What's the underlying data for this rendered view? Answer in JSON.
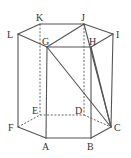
{
  "figure": {
    "stroke_color": "#555555",
    "background": "#ffffff",
    "vertices": {
      "A": {
        "x": 46,
        "y": 138,
        "label": "A",
        "lx": 42,
        "ly": 150
      },
      "B": {
        "x": 91,
        "y": 138,
        "label": "B",
        "lx": 87,
        "ly": 150
      },
      "C": {
        "x": 111,
        "y": 127,
        "label": "C",
        "lx": 114,
        "ly": 131
      },
      "D": {
        "x": 84,
        "y": 115,
        "label": "D",
        "lx": 75,
        "ly": 114
      },
      "E": {
        "x": 40,
        "y": 115,
        "label": "E",
        "lx": 32,
        "ly": 114
      },
      "F": {
        "x": 18,
        "y": 127,
        "label": "F",
        "lx": 8,
        "ly": 131
      },
      "G": {
        "x": 47,
        "y": 47,
        "label": "G",
        "lx": 42,
        "ly": 45
      },
      "H": {
        "x": 91,
        "y": 47,
        "label": "H",
        "lx": 89,
        "ly": 45
      },
      "I": {
        "x": 113,
        "y": 34,
        "label": "I",
        "lx": 116,
        "ly": 38
      },
      "J": {
        "x": 84,
        "y": 24,
        "label": "J",
        "lx": 81,
        "ly": 21
      },
      "K": {
        "x": 40,
        "y": 24,
        "label": "K",
        "lx": 36,
        "ly": 21
      },
      "L": {
        "x": 18,
        "y": 34,
        "label": "L",
        "lx": 7,
        "ly": 38
      }
    },
    "solid_edges": [
      [
        "L",
        "K"
      ],
      [
        "K",
        "J"
      ],
      [
        "J",
        "I"
      ],
      [
        "I",
        "H"
      ],
      [
        "H",
        "G"
      ],
      [
        "G",
        "L"
      ],
      [
        "L",
        "F"
      ],
      [
        "G",
        "A"
      ],
      [
        "H",
        "B"
      ],
      [
        "I",
        "C"
      ],
      [
        "F",
        "A"
      ],
      [
        "A",
        "B"
      ],
      [
        "B",
        "C"
      ],
      [
        "J",
        "G"
      ],
      [
        "J",
        "C"
      ],
      [
        "H",
        "C"
      ],
      [
        "G",
        "C"
      ]
    ],
    "dashed_edges": [
      [
        "K",
        "E"
      ],
      [
        "J",
        "D"
      ],
      [
        "F",
        "E"
      ],
      [
        "E",
        "D"
      ],
      [
        "D",
        "C"
      ]
    ]
  }
}
